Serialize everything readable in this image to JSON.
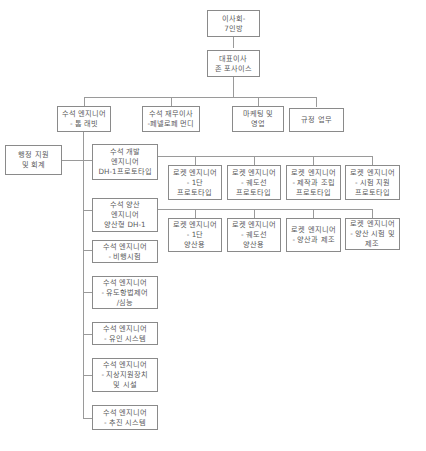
{
  "chart": {
    "board": "이사회-\n7인방",
    "ceo": "대표이사\n존 포사이스",
    "level1": [
      "수석 엔지니어\n- 톰 래빗",
      "수석 재무이사\n-페넬로페 먼디",
      "마케팅 및\n영업",
      "규정 업무"
    ],
    "admin": "행정 지원\n및 회계",
    "engineering": [
      "수석 개발\n엔지니어\nDH-1프로토타입",
      "수석 양산\n엔지니어\n양산형 DH-1",
      "수석 엔지니어\n- 비행시험",
      "수석 엔지니어\n- 유도항법제어\n/심능",
      "수석 엔지니어\n- 유인 시스템",
      "수석 엔지니어\n- 지상지원장치\n및 시설",
      "수석 엔지니어\n- 추진 시스템"
    ],
    "prototype_rockets": [
      "로켓 엔지니어\n- 1단\n프로토타입",
      "로켓 엔지니어\n- 궤도선\n프로토타입",
      "로켓 엔지니어\n- 제작과 조립\n프로토타입",
      "로켓 엔지니어\n- 시험 지원\n프로토타입"
    ],
    "production_rockets": [
      "로켓 엔지니어\n- 1단\n양산용",
      "로켓 엔지니어\n- 궤도선\n양산용",
      "로켓 엔지니어\n- 양산과 제조",
      "로켓 엔지니어\n- 양산 시험 및\n제조"
    ]
  }
}
